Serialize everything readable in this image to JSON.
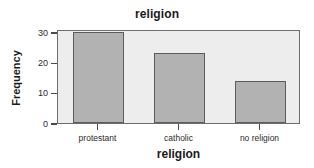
{
  "chart_data": {
    "type": "bar",
    "title": "religion",
    "xlabel": "religion",
    "ylabel": "Frequency",
    "categories": [
      "protestant",
      "catholic",
      "no religion"
    ],
    "values": [
      30,
      23,
      14
    ],
    "ylim": [
      0,
      31
    ],
    "y_ticks": [
      0,
      10,
      20,
      30
    ],
    "y_tick_labels": [
      "0",
      "10",
      "20",
      "30"
    ],
    "grid": false,
    "legend": "none",
    "colors": {
      "bar_fill": "#b2b2b2",
      "bar_border": "#5c5c5c",
      "plot_background": "#ededed",
      "frame_border": "#6d6d6d",
      "text": "#1a1a1a",
      "page_background": "#ffffff"
    }
  }
}
